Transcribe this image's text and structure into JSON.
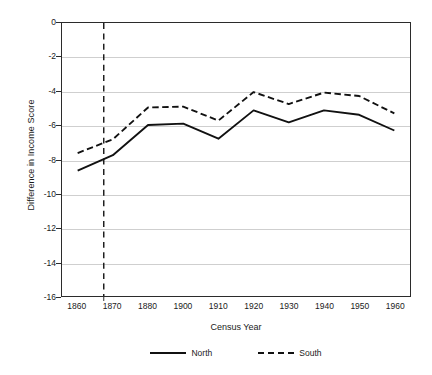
{
  "chart_data": {
    "type": "line",
    "title": "",
    "xlabel": "Census Year",
    "ylabel": "Difference in Income Score",
    "categories": [
      "1860",
      "1870",
      "1880",
      "1900",
      "1910",
      "1920",
      "1930",
      "1940",
      "1950",
      "1960"
    ],
    "ylim": [
      -16,
      0
    ],
    "yticks": [
      "0",
      "-2",
      "-4",
      "-6",
      "-8",
      "-10",
      "-12",
      "-14",
      "-16"
    ],
    "ytick_values": [
      0,
      -2,
      -4,
      -6,
      -8,
      -10,
      -12,
      -14,
      -16
    ],
    "grid": true,
    "legend_position": "bottom",
    "series": [
      {
        "name": "North",
        "style": "solid",
        "color": "#111111",
        "values": [
          -8.65,
          -7.75,
          -5.98,
          -5.9,
          -6.78,
          -5.12,
          -5.82,
          -5.12,
          -5.38,
          -6.3
        ]
      },
      {
        "name": "South",
        "style": "dashed",
        "color": "#111111",
        "values": [
          -7.62,
          -6.82,
          -4.95,
          -4.9,
          -5.72,
          -4.05,
          -4.75,
          -4.08,
          -4.28,
          -5.3
        ]
      }
    ],
    "annotations": [
      {
        "name": "civil-war-reference-line",
        "type": "vline",
        "x_fraction": 0.12,
        "style": "dashed",
        "color": "#111111"
      }
    ]
  },
  "legend": {
    "items": [
      {
        "label": "North",
        "style": "solid"
      },
      {
        "label": "South",
        "style": "dashed"
      }
    ]
  }
}
